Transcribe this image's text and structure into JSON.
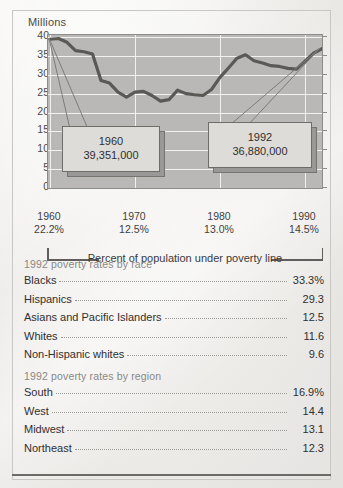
{
  "chart_data": {
    "type": "line",
    "title": "Millions",
    "ylabel": "Millions",
    "xlabel": "Percent of population under poverty line",
    "ylim": [
      0,
      40
    ],
    "yticks": [
      "0",
      "5",
      "10",
      "15",
      "20",
      "25",
      "30",
      "35",
      "40"
    ],
    "xlim": [
      1960,
      1992
    ],
    "grid": true,
    "legend": "none",
    "x": [
      1960,
      1961,
      1962,
      1963,
      1964,
      1965,
      1966,
      1967,
      1968,
      1969,
      1970,
      1971,
      1972,
      1973,
      1974,
      1975,
      1976,
      1977,
      1978,
      1979,
      1980,
      1981,
      1982,
      1983,
      1984,
      1985,
      1986,
      1987,
      1988,
      1989,
      1990,
      1991,
      1992
    ],
    "values": [
      39.4,
      39.6,
      38.6,
      36.4,
      36.1,
      35.5,
      28.5,
      27.8,
      25.4,
      24.1,
      25.4,
      25.6,
      24.5,
      23.0,
      23.4,
      25.9,
      25.0,
      24.7,
      24.5,
      26.1,
      29.3,
      31.8,
      34.4,
      35.3,
      33.7,
      33.1,
      32.4,
      32.2,
      31.7,
      31.5,
      33.6,
      35.7,
      36.9
    ],
    "ylabel_unit": "Millions",
    "annotations": [
      {
        "name": "1960-callout",
        "year": "1960",
        "value": "39,351,000"
      },
      {
        "name": "1992-callout",
        "year": "1992",
        "value": "36,880,000"
      }
    ],
    "xaxis_groups": [
      {
        "year": "1960",
        "percent": "22.2%"
      },
      {
        "year": "1970",
        "percent": "12.5%"
      },
      {
        "year": "1980",
        "percent": "13.0%"
      },
      {
        "year": "1990",
        "percent": "14.5%"
      }
    ]
  },
  "chart": {
    "axis_title": "Millions",
    "caption": "Percent of population under poverty line",
    "callout_1960": {
      "year": "1960",
      "value": "39,351,000"
    },
    "callout_1992": {
      "year": "1992",
      "value": "36,880,000"
    }
  },
  "tables": [
    {
      "title": "1992 poverty rates by race",
      "rows": [
        {
          "label": "Blacks",
          "value": "33.3%"
        },
        {
          "label": "Hispanics",
          "value": "29.3"
        },
        {
          "label": "Asians and Pacific Islanders",
          "value": "12.5"
        },
        {
          "label": "Whites",
          "value": "11.6"
        },
        {
          "label": "Non-Hispanic whites",
          "value": "9.6"
        }
      ]
    },
    {
      "title": "1992 poverty rates by region",
      "rows": [
        {
          "label": "South",
          "value": "16.9%"
        },
        {
          "label": "West",
          "value": "14.4"
        },
        {
          "label": "Midwest",
          "value": "13.1"
        },
        {
          "label": "Northeast",
          "value": "12.3"
        }
      ]
    }
  ],
  "colors": {
    "plot_background": "#b9b8b6",
    "gridline": "#f2f1ef",
    "series_line": "#5a5956",
    "callout_face": "#dedcd8",
    "callout_shadow": "#9a9896",
    "page_background": "#efeeec",
    "text": "#2f2f2f",
    "muted_text": "#8a8885"
  }
}
